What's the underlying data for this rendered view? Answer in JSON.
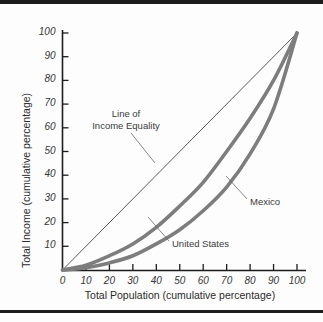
{
  "chart_data": {
    "type": "line",
    "title": "",
    "xlabel": "Total Population (cumulative percentage)",
    "ylabel": "Total Income (cumulative percentage)",
    "xlim": [
      0,
      100
    ],
    "ylim": [
      0,
      100
    ],
    "grid": false,
    "legend_position": "inline-annotations",
    "xticks": [
      "0",
      "10",
      "20",
      "30",
      "40",
      "50",
      "60",
      "70",
      "80",
      "90",
      "100"
    ],
    "yticks": [
      "10",
      "20",
      "30",
      "40",
      "50",
      "60",
      "70",
      "80",
      "90",
      "100"
    ],
    "annotations": [
      {
        "id": "equality",
        "text_line1": "Line of",
        "text_line2": "Income Equality"
      },
      {
        "id": "mexico",
        "text": "Mexico"
      },
      {
        "id": "united-states",
        "text": "United States"
      }
    ],
    "series": [
      {
        "name": "Line of Income Equality",
        "style": "thin",
        "color": "#5a5a5a",
        "x": [
          0,
          10,
          20,
          30,
          40,
          50,
          60,
          70,
          80,
          90,
          100
        ],
        "values": [
          0,
          10,
          20,
          30,
          40,
          50,
          60,
          70,
          80,
          90,
          100
        ]
      },
      {
        "name": "United States",
        "style": "thick",
        "color": "#7d7d7d",
        "x": [
          0,
          10,
          20,
          30,
          40,
          50,
          60,
          70,
          80,
          90,
          100
        ],
        "values": [
          0,
          2,
          6,
          11,
          18,
          27,
          37,
          50,
          64,
          80,
          100
        ]
      },
      {
        "name": "Mexico",
        "style": "thick",
        "color": "#7d7d7d",
        "x": [
          0,
          10,
          20,
          30,
          40,
          50,
          60,
          70,
          80,
          90,
          100
        ],
        "values": [
          0,
          1,
          3,
          6,
          11,
          17,
          25,
          35,
          49,
          68,
          100
        ]
      }
    ]
  },
  "colors": {
    "curve": "#7d7d7d",
    "equality_line": "#5a5a5a",
    "axis": "#1c1c1c",
    "rule": "#1c1c1c",
    "text": "#2b2b2b",
    "background": "#fdfdfd"
  },
  "axis": {
    "x_title": "Total Population (cumulative percentage)",
    "y_title": "Total Income (cumulative percentage)",
    "x_ticks": [
      "0",
      "10",
      "20",
      "30",
      "40",
      "50",
      "60",
      "70",
      "80",
      "90",
      "100"
    ],
    "y_ticks": [
      "100",
      "90",
      "80",
      "70",
      "60",
      "50",
      "40",
      "30",
      "20",
      "10"
    ]
  },
  "annotations": {
    "equality_line1": "Line of",
    "equality_line2": "Income Equality",
    "mexico": "Mexico",
    "united_states": "United States"
  }
}
